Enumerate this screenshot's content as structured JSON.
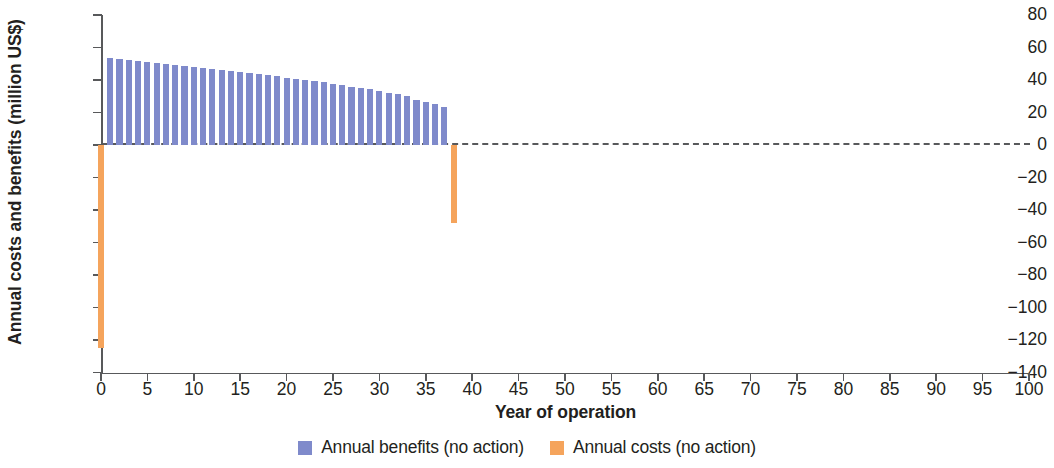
{
  "chart_data": {
    "type": "bar",
    "title": "",
    "xlabel": "Year of operation",
    "ylabel": "Annual costs and benefits (million US$)",
    "xlim": [
      0,
      100
    ],
    "ylim": [
      -140,
      80
    ],
    "xticks": [
      0,
      5,
      10,
      15,
      20,
      25,
      30,
      35,
      40,
      45,
      50,
      55,
      60,
      65,
      70,
      75,
      80,
      85,
      90,
      95,
      100
    ],
    "yticks": [
      80,
      60,
      40,
      20,
      0,
      -20,
      -40,
      -60,
      -80,
      -100,
      -120,
      -140
    ],
    "grid": false,
    "zero_line": true,
    "zero_line_style": "dashed",
    "legend_position": "bottom-center",
    "colors": {
      "benefits": "#7f8acb",
      "costs": "#f5a45c",
      "axis": "#58595b",
      "text": "#231f20",
      "background": "#ffffff"
    },
    "series": [
      {
        "name": "Annual benefits (no action)",
        "color": "#7f8acb",
        "x": [
          1,
          2,
          3,
          4,
          5,
          6,
          7,
          8,
          9,
          10,
          11,
          12,
          13,
          14,
          15,
          16,
          17,
          18,
          19,
          20,
          21,
          22,
          23,
          24,
          25,
          26,
          27,
          28,
          29,
          30,
          31,
          32,
          33,
          34,
          35,
          36,
          37
        ],
        "values": [
          53.5,
          52.8,
          52.2,
          51.6,
          51.0,
          50.4,
          49.8,
          49.2,
          48.6,
          48.0,
          47.4,
          46.8,
          46.2,
          45.6,
          45.0,
          44.3,
          43.6,
          42.9,
          42.2,
          41.5,
          40.8,
          40.1,
          39.3,
          38.5,
          37.7,
          36.9,
          36.0,
          35.1,
          34.2,
          33.2,
          32.2,
          31.1,
          30.0,
          28.0,
          26.5,
          25.0,
          23.5
        ]
      },
      {
        "name": "Annual costs (no action)",
        "color": "#f5a45c",
        "x": [
          0,
          38
        ],
        "values": [
          -125.0,
          -48.0
        ]
      }
    ]
  },
  "legend": {
    "items": [
      {
        "label": "Annual benefits (no action)",
        "swatch": "benefit"
      },
      {
        "label": "Annual costs (no action)",
        "swatch": "cost"
      }
    ]
  }
}
